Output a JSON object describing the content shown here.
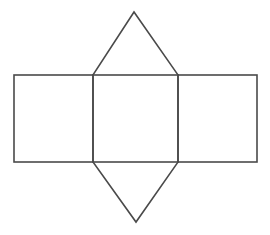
{
  "diagram": {
    "type": "geometric-net",
    "stroke_color": "#4a4a4a",
    "stroke_width": 1.6,
    "background": "#ffffff",
    "shapes": {
      "rect_left": {
        "x": 14,
        "y": 75,
        "width": 79,
        "height": 87
      },
      "rect_middle": {
        "x": 93,
        "y": 75,
        "width": 85,
        "height": 87
      },
      "rect_right": {
        "x": 178,
        "y": 75,
        "width": 79,
        "height": 87
      },
      "triangle_top": {
        "points": "93,75 134,12 178,75"
      },
      "triangle_bottom": {
        "points": "93,162 136,222 178,162"
      }
    }
  }
}
